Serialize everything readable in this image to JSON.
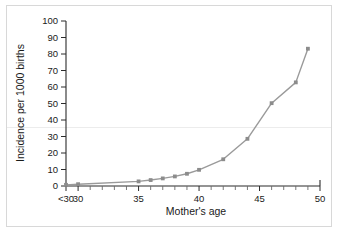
{
  "chart_data": {
    "type": "line",
    "title": "",
    "subtitle": "",
    "xlabel": "Mother's age",
    "ylabel": "Incidence per 1000 births",
    "xlim": [
      29,
      50
    ],
    "ylim": [
      0,
      100
    ],
    "grid": false,
    "legend": null,
    "legend_position": "none",
    "series_color": "#9a9a9a",
    "marker_color": "#8c8c8c",
    "axis_color": "#2b2b2b",
    "x_tick_labels": [
      "<30",
      "30",
      "35",
      "40",
      "45",
      "50"
    ],
    "x_tick_values": [
      29,
      30,
      35,
      40,
      45,
      50
    ],
    "y_tick_labels": [
      "0",
      "10",
      "20",
      "30",
      "40",
      "50",
      "60",
      "70",
      "80",
      "90",
      "100"
    ],
    "y_tick_values": [
      0,
      10,
      20,
      30,
      40,
      50,
      60,
      70,
      80,
      90,
      100
    ],
    "x_minor_ticks": [
      31,
      32,
      33,
      34,
      36,
      37,
      38,
      39,
      41,
      42,
      43,
      44,
      46,
      47,
      48,
      49
    ],
    "series": [
      {
        "name": "Incidence",
        "x": [
          29,
          30,
          35,
          36,
          37,
          38,
          39,
          40,
          42,
          44,
          46,
          48,
          49
        ],
        "values": [
          0.7,
          1.1,
          2.8,
          3.6,
          4.6,
          5.8,
          7.4,
          9.8,
          16.2,
          28.6,
          50.2,
          62.8,
          83.2
        ]
      }
    ]
  },
  "figure": {
    "background_color": "#ffffff",
    "border_color": "#d8d8d8"
  }
}
